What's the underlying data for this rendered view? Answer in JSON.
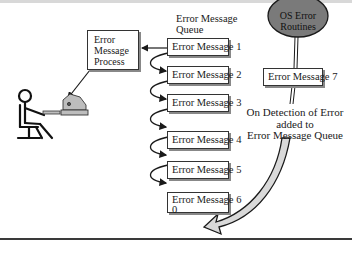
{
  "diagram": {
    "process_box": {
      "line1": "Error",
      "line2": "Message",
      "line3": "Process"
    },
    "queue_title": {
      "line1": "Error Message",
      "line2": "Queue"
    },
    "queue_items": [
      {
        "label": "Error Message 1"
      },
      {
        "label": "Error Message 2"
      },
      {
        "label": "Error Message 3"
      },
      {
        "label": "Error Message 4"
      },
      {
        "label": "Error Message 5"
      },
      {
        "label": "Error Message 6",
        "sublabel": "0"
      }
    ],
    "os_routines": {
      "line1": "OS Error",
      "line2": "Routines",
      "fill": "#7a7a7a"
    },
    "new_message": {
      "label": "Error Message 7"
    },
    "annotation": {
      "line1": "On Detection of Error",
      "line2": "added to",
      "line3": "Error Message Queue"
    },
    "icons": [
      "person-at-desk-icon",
      "printer-icon"
    ],
    "colors": {
      "arrow_fill": "#d9d9d9",
      "printer": "#bdbdbd",
      "stroke": "#1a1a1a"
    }
  }
}
